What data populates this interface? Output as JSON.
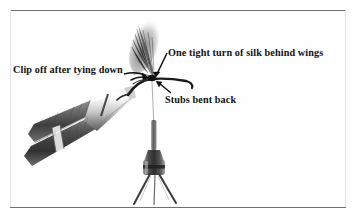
{
  "figure": {
    "kind": "instructional-photograph",
    "background_color": "#fefefe",
    "ink_color": "#15120f",
    "rule_color": "#6f6f6f"
  },
  "rules": {
    "top_label": "top-horizontal-rule",
    "bottom_label": "bottom-horizontal-rule",
    "left_label": "left-vertical-rule",
    "right_label": "right-vertical-rule"
  },
  "annotations": [
    {
      "id": "one-tight-turn",
      "text": "One tight turn of silk behind wings",
      "arrow": "points down-left to the silk turn behind the wings"
    },
    {
      "id": "clip-off",
      "text": "Clip off after tying down",
      "arrow": "points right to the tied-down butt ends on the shank"
    },
    {
      "id": "stubs-bent-back",
      "text": "Stubs bent back",
      "arrow": "points up-left to the bent-back wing stubs"
    }
  ],
  "photo_parts": [
    {
      "id": "vise",
      "label": "fly-tying vise jaws"
    },
    {
      "id": "vise-barrel",
      "label": "vise barrel"
    },
    {
      "id": "hook",
      "label": "hook held in vise"
    },
    {
      "id": "feather-wing",
      "label": "upright feather wing"
    },
    {
      "id": "silk-thread",
      "label": "tying silk running to bobbin"
    },
    {
      "id": "bobbin",
      "label": "thread bobbin holder"
    }
  ]
}
